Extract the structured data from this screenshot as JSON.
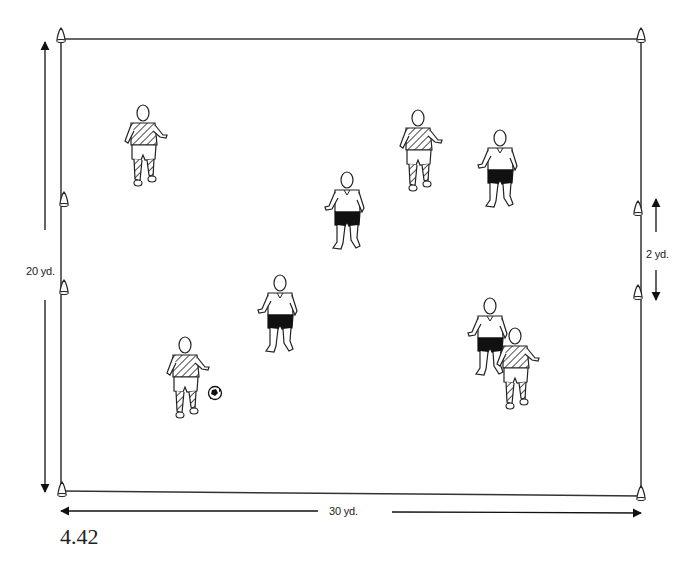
{
  "figure": {
    "label": "4.42",
    "type": "soccer drill diagram"
  },
  "field": {
    "width_label": "30 yd.",
    "height_label": "20 yd.",
    "goal_width_label": "2 yd.",
    "line_color": "#333333",
    "background": "#ffffff"
  },
  "cones": [
    {
      "position": "top-left corner"
    },
    {
      "position": "top-right corner"
    },
    {
      "position": "bottom-left corner"
    },
    {
      "position": "bottom-right corner"
    },
    {
      "position": "left goal upper"
    },
    {
      "position": "left goal lower"
    },
    {
      "position": "right goal upper"
    },
    {
      "position": "right goal lower"
    }
  ],
  "players": [
    {
      "team": "striped",
      "shorts": "white",
      "x": 143,
      "y": 150
    },
    {
      "team": "striped",
      "shorts": "white",
      "x": 418,
      "y": 155
    },
    {
      "team": "white",
      "shorts": "black",
      "x": 500,
      "y": 172
    },
    {
      "team": "white",
      "shorts": "black",
      "x": 347,
      "y": 213
    },
    {
      "team": "white",
      "shorts": "black",
      "x": 280,
      "y": 318
    },
    {
      "team": "striped",
      "shorts": "white",
      "x": 185,
      "y": 378
    },
    {
      "team": "white",
      "shorts": "black",
      "x": 490,
      "y": 340
    },
    {
      "team": "striped",
      "shorts": "white",
      "x": 515,
      "y": 362
    }
  ],
  "ball": {
    "x": 215,
    "y": 393
  }
}
